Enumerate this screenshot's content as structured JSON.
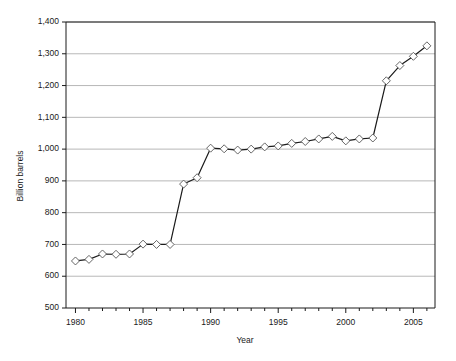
{
  "chart_data": {
    "type": "line",
    "title": "",
    "xlabel": "Year",
    "ylabel": "Billion barrels",
    "xlim": [
      1979.3,
      2006.6
    ],
    "ylim": [
      500,
      1400
    ],
    "ytick_values": [
      500,
      600,
      700,
      800,
      900,
      1000,
      1100,
      1200,
      1300,
      1400
    ],
    "ytick_labels": [
      "500",
      "600",
      "700",
      "800",
      "900",
      "1,000",
      "1,100",
      "1,200",
      "1,300",
      "1,400"
    ],
    "xtick_values": [
      1980,
      1981,
      1982,
      1983,
      1984,
      1985,
      1986,
      1987,
      1988,
      1989,
      1990,
      1991,
      1992,
      1993,
      1994,
      1995,
      1996,
      1997,
      1998,
      1999,
      2000,
      2001,
      2002,
      2003,
      2004,
      2005,
      2006
    ],
    "xtick_labeled": [
      1980,
      1985,
      1990,
      1995,
      2000,
      2005
    ],
    "xtick_labels": [
      "1980",
      "1985",
      "1990",
      "1995",
      "2000",
      "2005"
    ],
    "grid": "horizontal",
    "legend": "none",
    "marker": "open-diamond",
    "line_color": "#1a1a1a",
    "marker_fill": "#ffffff",
    "marker_edge": "#555555",
    "grid_color": "#9a9a9a",
    "axis_color": "#1a1a1a",
    "series": [
      {
        "name": "World proved oil reserves",
        "x": [
          1980,
          1981,
          1982,
          1983,
          1984,
          1985,
          1986,
          1987,
          1988,
          1989,
          1990,
          1991,
          1992,
          1993,
          1994,
          1995,
          1996,
          1997,
          1998,
          1999,
          2000,
          2001,
          2002,
          2003,
          2004,
          2005,
          2006
        ],
        "values": [
          648,
          653,
          670,
          669,
          670,
          701,
          700,
          700,
          890,
          910,
          1003,
          1001,
          997,
          1000,
          1007,
          1010,
          1018,
          1024,
          1032,
          1040,
          1026,
          1032,
          1035,
          1215,
          1263,
          1292,
          1325
        ]
      }
    ]
  },
  "axes": {
    "y_title": "Billion barrels",
    "x_title": "Year"
  }
}
